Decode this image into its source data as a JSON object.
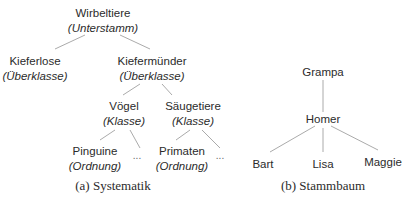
{
  "figure_a": {
    "caption": "(a) Systematik",
    "nodes": [
      {
        "name": "Wirbeltiere",
        "rank": "(Unterstamm)"
      },
      {
        "name": "Kieferlose",
        "rank": "(Überklasse)"
      },
      {
        "name": "Kiefermünder",
        "rank": "(Überklasse)"
      },
      {
        "name": "Vögel",
        "rank": "(Klasse)"
      },
      {
        "name": "Säugetiere",
        "rank": "(Klasse)"
      },
      {
        "name": "Pinguine",
        "rank": "(Ordnung)"
      },
      {
        "name": "Primaten",
        "rank": "(Ordnung)"
      }
    ],
    "ellipsis": "..."
  },
  "figure_b": {
    "caption": "(b) Stammbaum",
    "nodes": [
      "Grampa",
      "Homer",
      "Bart",
      "Lisa",
      "Maggie"
    ]
  },
  "colors": {
    "line": "#9a9a9a",
    "text": "#2b2b2b"
  }
}
